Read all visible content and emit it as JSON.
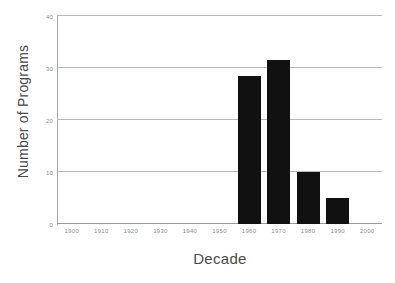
{
  "chart_data": {
    "type": "bar",
    "title": "",
    "xlabel": "Decade",
    "ylabel": "Number of Programs",
    "categories": [
      "1900",
      "1910",
      "1920",
      "1930",
      "1940",
      "1950",
      "1960",
      "1970",
      "1980",
      "1990",
      "2000"
    ],
    "values": [
      0,
      0,
      0,
      0,
      0,
      0,
      28.5,
      31.5,
      10,
      5,
      0
    ],
    "xlim": [
      "1900",
      "2000"
    ],
    "ylim": [
      0,
      40
    ],
    "yticks": [
      0,
      10,
      20,
      30,
      40
    ],
    "ytick_labels": [
      "0",
      "10",
      "20",
      "30",
      "40"
    ],
    "xtick_labels": [
      "1900",
      "1910",
      "1920",
      "1930",
      "1940",
      "1950",
      "1960",
      "1970",
      "1980",
      "1990",
      "2000"
    ],
    "grid": "horizontal",
    "legend": "none",
    "bar_color": "#111111",
    "grid_color": "#b9b9b9",
    "axis_color": "#a8a8a8",
    "text_color": "#4a4a4a",
    "tick_text_color": "#8d8d8d",
    "background_color": "#ffffff"
  }
}
